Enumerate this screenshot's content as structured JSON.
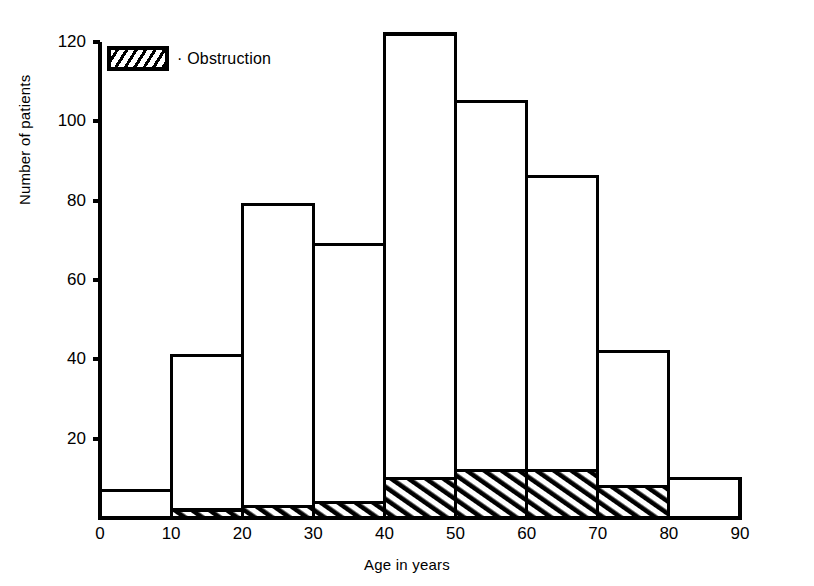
{
  "chart_data": {
    "type": "bar",
    "title": "",
    "xlabel": "Age in years",
    "ylabel": "Number of patients",
    "xlim": [
      0,
      90
    ],
    "ylim": [
      0,
      120
    ],
    "xticks": [
      0,
      10,
      20,
      30,
      40,
      50,
      60,
      70,
      80,
      90
    ],
    "yticks": [
      0,
      20,
      40,
      60,
      80,
      100,
      120
    ],
    "grid": false,
    "legend_position": "top-left",
    "bin_edges": [
      0,
      10,
      20,
      30,
      40,
      50,
      60,
      70,
      80,
      90
    ],
    "categories": [
      "0-10",
      "10-20",
      "20-30",
      "30-40",
      "40-50",
      "50-60",
      "60-70",
      "70-80",
      "80-90"
    ],
    "series": [
      {
        "name": "Total",
        "values": [
          7,
          41,
          79,
          69,
          122,
          105,
          86,
          42,
          10
        ]
      },
      {
        "name": "Obstruction",
        "values": [
          0,
          2,
          3,
          4,
          10,
          12,
          12,
          8,
          0
        ]
      }
    ],
    "legend": [
      {
        "label": "· Obstruction",
        "pattern": "diagonal-hatch",
        "color": "#000000"
      }
    ],
    "colors": {
      "line": "#000000",
      "background": "#ffffff",
      "hatch": "#000000"
    }
  }
}
